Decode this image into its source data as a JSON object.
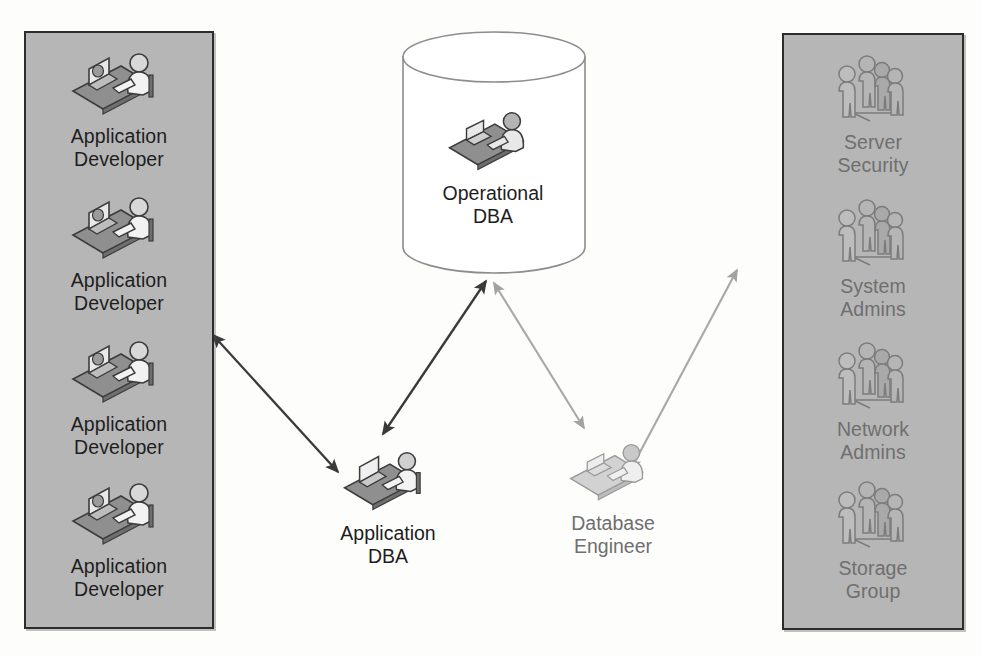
{
  "diagram": {
    "background_color": "#fdfdfc",
    "panel_fill": "#b6b6b6",
    "panel_border": "#2c2c2c",
    "dark_ink": "#1e1e1e",
    "light_ink": "#9a9a9a",
    "arrow_dark": "#3a3a3a",
    "arrow_light": "#a8a8a8"
  },
  "left_panel": {
    "name": "Application Developers group",
    "entries": [
      {
        "label": "Application\nDeveloper",
        "icon": "person-at-desk-icon",
        "tone": "dark"
      },
      {
        "label": "Application\nDeveloper",
        "icon": "person-at-desk-icon",
        "tone": "dark"
      },
      {
        "label": "Application\nDeveloper",
        "icon": "person-at-desk-icon",
        "tone": "dark"
      },
      {
        "label": "Application\nDeveloper",
        "icon": "person-at-desk-icon",
        "tone": "dark"
      }
    ]
  },
  "right_panel": {
    "name": "Infrastructure teams group",
    "entries": [
      {
        "label": "Server\nSecurity",
        "icon": "people-group-icon",
        "tone": "light"
      },
      {
        "label": "System\nAdmins",
        "icon": "people-group-icon",
        "tone": "light"
      },
      {
        "label": "Network\nAdmins",
        "icon": "people-group-icon",
        "tone": "light"
      },
      {
        "label": "Storage\nGroup",
        "icon": "people-group-icon",
        "tone": "light"
      }
    ]
  },
  "center": {
    "operational_dba": {
      "label": "Operational\nDBA",
      "icon": "person-at-desk-icon",
      "shape": "database-cylinder",
      "tone": "dark"
    },
    "application_dba": {
      "label": "Application\nDBA",
      "icon": "person-at-desk-icon",
      "tone": "dark"
    },
    "database_engineer": {
      "label": "Database\nEngineer",
      "icon": "person-at-desk-icon",
      "tone": "light"
    }
  },
  "connectors": [
    {
      "name": "developers-to-application-dba",
      "from": "Application Developers panel",
      "to": "Application DBA",
      "style": "double-headed",
      "tone": "dark"
    },
    {
      "name": "application-dba-to-operational-dba",
      "from": "Application DBA",
      "to": "Operational DBA",
      "style": "double-headed",
      "tone": "dark"
    },
    {
      "name": "operational-dba-to-database-engineer",
      "from": "Operational DBA",
      "to": "Database Engineer",
      "style": "double-headed",
      "tone": "light"
    },
    {
      "name": "database-engineer-to-infrastructure",
      "from": "Database Engineer",
      "to": "Infrastructure teams panel",
      "style": "double-headed",
      "tone": "light"
    }
  ]
}
